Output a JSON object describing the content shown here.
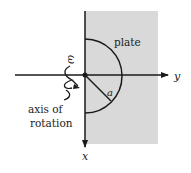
{
  "diagram": {
    "labels": {
      "plate": "plate",
      "omega": "ω",
      "omega_arrow": "→",
      "radius": "a",
      "axis_y": "y",
      "axis_x": "x",
      "rotation_line1": "axis of",
      "rotation_line2": "rotation"
    },
    "colors": {
      "plate_fill": "#d9d9d9",
      "line": "#1a1a1a"
    }
  }
}
